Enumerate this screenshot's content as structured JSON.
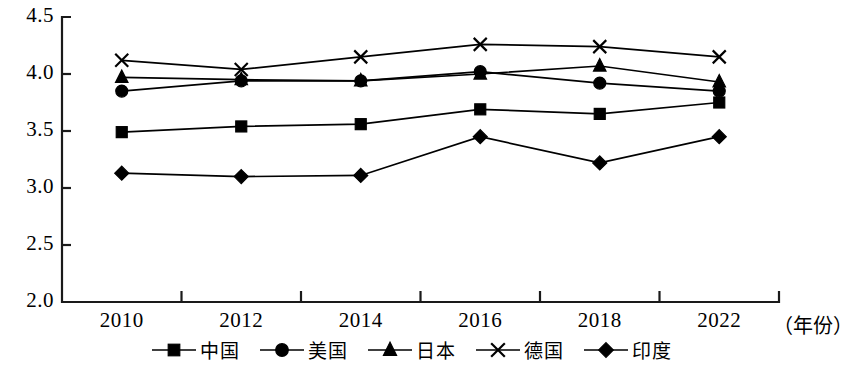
{
  "chart_data": {
    "type": "line",
    "title": "",
    "xlabel": "（年份）",
    "ylabel": "",
    "categories": [
      "2010",
      "2012",
      "2014",
      "2016",
      "2018",
      "2022"
    ],
    "ylim": [
      2.0,
      4.5
    ],
    "yticks": [
      "2.0",
      "2.5",
      "3.0",
      "3.5",
      "4.0",
      "4.5"
    ],
    "grid": false,
    "legend_position": "bottom",
    "series": [
      {
        "name": "中国",
        "marker": "square",
        "values": [
          3.49,
          3.54,
          3.56,
          3.69,
          3.65,
          3.75
        ]
      },
      {
        "name": "美国",
        "marker": "circle",
        "values": [
          3.85,
          3.94,
          3.94,
          4.02,
          3.92,
          3.85
        ]
      },
      {
        "name": "日本",
        "marker": "triangle",
        "values": [
          3.97,
          3.95,
          3.94,
          4.0,
          4.07,
          3.93
        ]
      },
      {
        "name": "德国",
        "marker": "x",
        "values": [
          4.12,
          4.04,
          4.15,
          4.26,
          4.24,
          4.15
        ]
      },
      {
        "name": "印度",
        "marker": "diamond",
        "values": [
          3.13,
          3.1,
          3.11,
          3.45,
          3.22,
          3.45
        ]
      }
    ]
  }
}
